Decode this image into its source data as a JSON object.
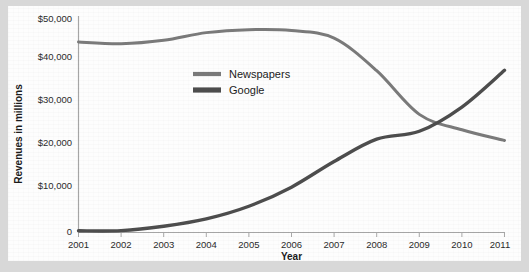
{
  "chart_data": {
    "type": "line",
    "title": "",
    "xlabel": "Year",
    "ylabel": "Revenues in millions",
    "x": [
      2001,
      2002,
      2003,
      2004,
      2005,
      2006,
      2007,
      2008,
      2009,
      2010,
      2011
    ],
    "xtick_labels": [
      "2001",
      "2002",
      "2003",
      "2004",
      "2005",
      "2006",
      "2007",
      "2008",
      "2009",
      "2010",
      "2011"
    ],
    "ytick_labels": [
      "$50,000",
      "$40,000",
      "$30,000",
      "$20,000",
      "$10,000",
      "0"
    ],
    "ytick_values": [
      50000,
      40000,
      30000,
      20000,
      10000,
      0
    ],
    "xlim": [
      2001,
      2011
    ],
    "ylim": [
      0,
      50000
    ],
    "grid": false,
    "legend_position": "upper-center-left",
    "series": [
      {
        "name": "Newspapers",
        "color": "#7a7a7a",
        "values": [
          44500,
          44100,
          44900,
          46700,
          47400,
          47200,
          45400,
          37800,
          27600,
          24000,
          21500
        ]
      },
      {
        "name": "Google",
        "color": "#4d4d4d",
        "values": [
          400,
          440,
          1470,
          3190,
          6140,
          10600,
          16590,
          21800,
          23650,
          29320,
          37900
        ]
      }
    ]
  },
  "legend": {
    "items": [
      {
        "label": "Newspapers"
      },
      {
        "label": "Google"
      }
    ]
  },
  "axes": {
    "y_title": "Revenues in millions",
    "x_title": "Year"
  },
  "colors": {
    "page_background": "#d8d8d8",
    "card_background": "#fdfdfd",
    "axis": "#a8a8a8",
    "text": "#1b1b1b",
    "newspapers": "#7a7a7a",
    "google": "#4d4d4d"
  }
}
